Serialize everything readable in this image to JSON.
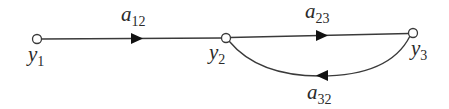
{
  "diagram": {
    "type": "signal-flow-graph",
    "colors": {
      "stroke": "#3a3a3a",
      "text": "#2a2a2a",
      "background": "#ffffff"
    },
    "nodes": [
      {
        "id": "y1",
        "base": "y",
        "sub": "1",
        "x": 37,
        "y": 39,
        "label_x": 28,
        "label_y": 46
      },
      {
        "id": "y2",
        "base": "y",
        "sub": "2",
        "x": 226,
        "y": 38,
        "label_x": 209,
        "label_y": 44
      },
      {
        "id": "y3",
        "base": "y",
        "sub": "3",
        "x": 413,
        "y": 33,
        "label_x": 411,
        "label_y": 40
      }
    ],
    "edges": [
      {
        "id": "a12",
        "from": "y1",
        "to": "y2",
        "base": "a",
        "sub": "12",
        "label_x": 121,
        "label_y": 6
      },
      {
        "id": "a23",
        "from": "y2",
        "to": "y3",
        "base": "a",
        "sub": "23",
        "label_x": 305,
        "label_y": 3
      },
      {
        "id": "a32",
        "from": "y3",
        "to": "y2",
        "base": "a",
        "sub": "32",
        "label_x": 307,
        "label_y": 84
      }
    ]
  }
}
